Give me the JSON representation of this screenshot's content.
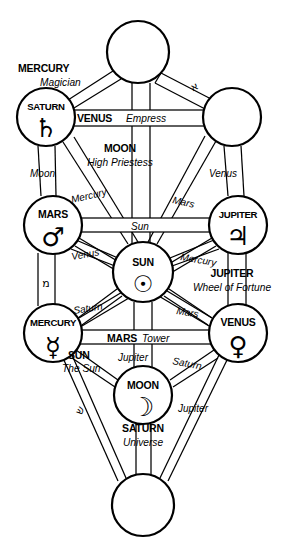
{
  "diagram": {
    "type": "tree-of-life",
    "ink_color": "#000000",
    "background_color": "#ffffff"
  },
  "sefirot": [
    {
      "id": "kether",
      "planet_label": "",
      "glyph": "",
      "cx": 138,
      "cy": 52,
      "r": 31
    },
    {
      "id": "chokmah",
      "planet_label": "",
      "glyph": "",
      "cx": 232,
      "cy": 117,
      "r": 29
    },
    {
      "id": "binah",
      "planet_label": "SATURN",
      "glyph": "♄",
      "cx": 46,
      "cy": 117,
      "r": 29
    },
    {
      "id": "chesed",
      "planet_label": "JUPITER",
      "glyph": "♃",
      "cx": 238,
      "cy": 225,
      "r": 29
    },
    {
      "id": "geburah",
      "planet_label": "MARS",
      "glyph": "♂",
      "cx": 53,
      "cy": 225,
      "r": 29
    },
    {
      "id": "tiphareth",
      "planet_label": "SUN",
      "glyph": "☉",
      "cx": 143,
      "cy": 272,
      "r": 30
    },
    {
      "id": "netzach",
      "planet_label": "VENUS",
      "glyph": "♀",
      "cx": 238,
      "cy": 333,
      "r": 29
    },
    {
      "id": "hod",
      "planet_label": "MERCURY",
      "glyph": "☿",
      "cx": 53,
      "cy": 333,
      "r": 29
    },
    {
      "id": "yesod",
      "planet_label": "MOON",
      "glyph": "☽",
      "cx": 143,
      "cy": 395,
      "r": 29
    },
    {
      "id": "malkuth",
      "planet_label": "",
      "glyph": "",
      "cx": 143,
      "cy": 505,
      "r": 31
    }
  ],
  "major_labels": [
    {
      "planet": "MERCURY",
      "tarot": "Magician",
      "x": 48,
      "y": 72
    },
    {
      "planet": "VENUS",
      "tarot": "Empress",
      "x": 70,
      "y": 121
    },
    {
      "planet": "MOON",
      "tarot": "High Priestess",
      "x": 103,
      "y": 152
    },
    {
      "planet": "JUPITER",
      "tarot": "Wheel of Fortune",
      "x": 186,
      "y": 277
    },
    {
      "planet": "MARS",
      "tarot": "Tower",
      "x": 104,
      "y": 337
    },
    {
      "planet": "SUN",
      "tarot": "The Sun",
      "x": 68,
      "y": 355
    },
    {
      "planet": "SATURN",
      "tarot": "Universe",
      "x": 110,
      "y": 426
    }
  ],
  "path_labels": [
    {
      "text": "Moon",
      "x": 30,
      "y": 177
    },
    {
      "text": "Venus",
      "x": 209,
      "y": 177
    },
    {
      "text": "Mercury",
      "x": 72,
      "y": 203
    },
    {
      "text": "Mars",
      "x": 172,
      "y": 203
    },
    {
      "text": "Sun",
      "x": 131,
      "y": 227
    },
    {
      "text": "Venus",
      "x": 72,
      "y": 260
    },
    {
      "text": "Mercury",
      "x": 180,
      "y": 260
    },
    {
      "text": "Saturn",
      "x": 74,
      "y": 311
    },
    {
      "text": "Mars",
      "x": 176,
      "y": 311
    },
    {
      "text": "Jupiter",
      "x": 118,
      "y": 358
    },
    {
      "text": "Saturn",
      "x": 168,
      "y": 360
    },
    {
      "text": "Jupiter",
      "x": 175,
      "y": 412
    }
  ],
  "hebrew_letters": [
    {
      "letter": "א",
      "x": 196,
      "y": 86,
      "rotation": -28
    },
    {
      "letter": "מ",
      "x": 46,
      "y": 283,
      "rotation": 0
    },
    {
      "letter": "ש",
      "x": 83,
      "y": 408,
      "rotation": -62
    }
  ]
}
